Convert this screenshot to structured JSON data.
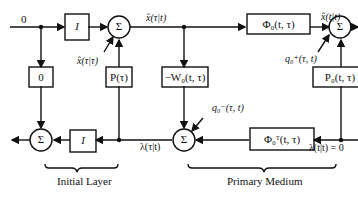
{
  "diagram": {
    "type": "block-diagram",
    "blocks": {
      "identity_top": "I",
      "zero_gain": "0",
      "p_tau": "P(τ)",
      "neg_w0": "−W₀(t, τ)",
      "phi0": "Φ₀(t, τ)",
      "p0": "P₀(t, τ)",
      "identity_bottom": "I",
      "phi0_transpose": "Φ₀ᵀ(t, τ)"
    },
    "summers": {
      "sum_symbol": "Σ"
    },
    "signals": {
      "input_top": "0",
      "x_hat_tau_t": "x̂(τ|t)",
      "x_hat_tau_tau": "x̂(τ|τ)",
      "q0_plus": "q₀⁺(τ, t)",
      "x_hat_t_t": "x̂(t|t)",
      "q0_minus": "q₀⁻(τ, t)",
      "lambda_tau_t": "λ(τ|t)",
      "lambda_t_t": "λ(t|t) = 0"
    },
    "sections": {
      "initial_layer": "Initial Layer",
      "primary_medium": "Primary Medium"
    }
  }
}
